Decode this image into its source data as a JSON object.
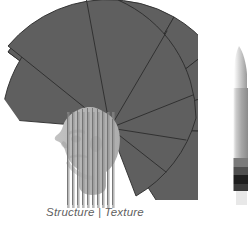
{
  "figure": {
    "caption": "Structure | Texture",
    "panels": [
      {
        "id": "left-panel",
        "name": "structure-texture-fan-diagram",
        "caption": "Structure | Texture",
        "elements": [
          "fan-sector",
          "head-silhouette",
          "vertical-stripe-overlay"
        ]
      },
      {
        "id": "right-panel",
        "name": "cropped-vertical-figure",
        "caption": ""
      }
    ]
  },
  "colors": {
    "fan_fill": "#5f5f5f",
    "fan_stroke": "#2b2b2b",
    "head_fill": "#b9b9b9",
    "head_shadow": "#a5a5a5",
    "stripe_dark": "#8c8c8c",
    "stripe_line": "#6e6e6e",
    "caption_text": "#5f5f5f",
    "background": "#ffffff",
    "right_figure_light": "#c9c9c9",
    "right_figure_mid": "#8f8f8f",
    "right_figure_dark": "#2a2a2a"
  },
  "fan": {
    "center_x": 110,
    "center_y": 128,
    "radius": 128,
    "start_angle_deg": -182,
    "end_angle_deg": -18,
    "segment_boundaries_deg": [
      -182,
      -135,
      -92,
      -62,
      -42,
      -30,
      -18
    ],
    "segment_count": 6
  },
  "head": {
    "center_x": 96,
    "center_y": 143,
    "width": 62,
    "height": 86,
    "facing": "left"
  },
  "stripes": {
    "count": 10,
    "x_start": 66,
    "x_end": 113,
    "y_top": 116,
    "y_bottom": 205,
    "line_color": "#6e6e6e"
  },
  "right_figure": {
    "x": 232,
    "y": 46,
    "width": 16,
    "height": 148,
    "band_count": 4
  }
}
